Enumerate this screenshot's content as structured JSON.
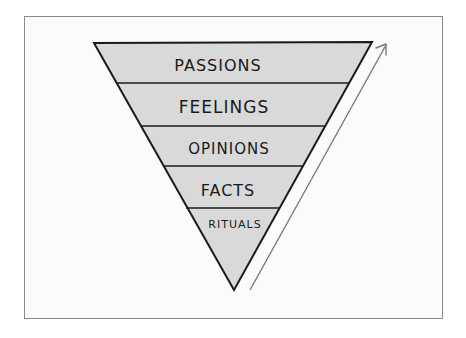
{
  "diagram": {
    "type": "inverted-pyramid",
    "colors": {
      "fill": "#d9d9d9",
      "stroke": "#1a1a1a",
      "arrow": "#7a7a7a",
      "frame": "#8a8a8a",
      "background": "#fbfbfb"
    },
    "layers": [
      {
        "label": "PASSIONS"
      },
      {
        "label": "FEELINGS"
      },
      {
        "label": "OPINIONS"
      },
      {
        "label": "FACTS"
      },
      {
        "label": "RITUALS"
      }
    ],
    "arrow": {
      "direction": "up"
    }
  }
}
